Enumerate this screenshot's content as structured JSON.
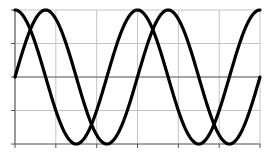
{
  "chart_data": {
    "type": "line",
    "title": "",
    "xlabel": "",
    "ylabel": "",
    "xlim": [
      0,
      12.566
    ],
    "ylim": [
      -1,
      1
    ],
    "x_ticks": [
      0,
      2.094,
      4.189,
      6.283,
      8.378,
      10.472,
      12.566
    ],
    "y_ticks": [
      -1,
      -0.5,
      0,
      0.5,
      1
    ],
    "tick_labels_visible": false,
    "grid": true,
    "legend": null,
    "series": [
      {
        "name": "cos(x)",
        "function": "cos",
        "color": "#000000",
        "x": [
          0,
          1.571,
          3.142,
          4.712,
          6.283,
          7.854,
          9.425,
          10.996,
          12.566
        ],
        "values": [
          1,
          0,
          -1,
          0,
          1,
          0,
          -1,
          0,
          1
        ]
      },
      {
        "name": "sin(x)",
        "function": "sin",
        "color": "#000000",
        "x": [
          0,
          1.571,
          3.142,
          4.712,
          6.283,
          7.854,
          9.425,
          10.996,
          12.566
        ],
        "values": [
          0,
          1,
          0,
          -1,
          0,
          1,
          0,
          -1,
          0
        ]
      }
    ]
  },
  "plot_area": {
    "left": 15,
    "top": 10,
    "right": 260,
    "bottom": 144
  },
  "colors": {
    "line": "#000000",
    "grid": "#c4c4c4",
    "axis": "#6a6a6a",
    "background": "#ffffff"
  }
}
